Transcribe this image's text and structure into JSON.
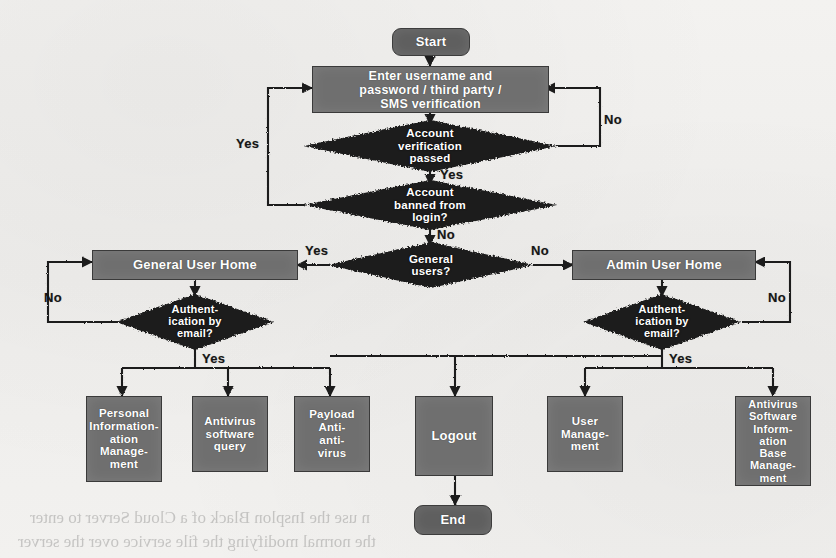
{
  "diagram": {
    "colors": {
      "node_fill": "#6f6f6f",
      "terminal_fill": "#5f5f5f",
      "decision_fill": "#1d1d1d",
      "node_text": "#ffffff",
      "edge_line": "#1a1a1a",
      "label_text": "#161616",
      "page_background": "#f1f0ee"
    },
    "nodes": {
      "start": {
        "label": "Start",
        "shape": "terminator"
      },
      "enter_credentials": {
        "label": "Enter username and password / third party / SMS verification",
        "shape": "process"
      },
      "verify_passed": {
        "label": "Account verification passed",
        "shape": "decision"
      },
      "banned": {
        "label": "Account banned from login?",
        "shape": "decision"
      },
      "general_users": {
        "label": "General users?",
        "shape": "decision"
      },
      "general_home": {
        "label": "General User Home",
        "shape": "process"
      },
      "admin_home": {
        "label": "Admin User Home",
        "shape": "process"
      },
      "auth_email_left": {
        "label": "Authent- ication by email?",
        "shape": "decision"
      },
      "auth_email_right": {
        "label": "Authent- ication by email?",
        "shape": "decision"
      },
      "personal_info": {
        "label": "Personal Information- Manage- ment",
        "shape": "process"
      },
      "antivirus_query": {
        "label": "Antivirus software query",
        "shape": "process"
      },
      "payload_antivirus": {
        "label": "Payload Anti- anti- virus",
        "shape": "process"
      },
      "logout": {
        "label": "Logout",
        "shape": "process"
      },
      "user_management": {
        "label": "User Manage- ment",
        "shape": "process"
      },
      "antivirus_base": {
        "label": "Antivirus Software Inform- ation Base Manage- ment",
        "shape": "process"
      },
      "end": {
        "label": "End",
        "shape": "terminator"
      }
    },
    "node_text_lines": {
      "start": [
        "Start"
      ],
      "enter_credentials": [
        "Enter username and",
        "password / third party /",
        "SMS verification"
      ],
      "verify_passed": [
        "Account",
        "verification",
        "passed"
      ],
      "banned": [
        "Account",
        "banned from",
        "login?"
      ],
      "general_users": [
        "General",
        "users?"
      ],
      "general_home": [
        "General User Home"
      ],
      "admin_home": [
        "Admin User Home"
      ],
      "auth_email_left": [
        "Authent-",
        "ication by",
        "email?"
      ],
      "auth_email_right": [
        "Authent-",
        "ication by",
        "email?"
      ],
      "personal_info": [
        "Personal",
        "Information-",
        "ation",
        "Manage-",
        "ment"
      ],
      "antivirus_query": [
        "Antivirus",
        "software",
        "query"
      ],
      "payload_antivirus": [
        "Payload",
        "Anti-",
        "anti-",
        "virus"
      ],
      "logout": [
        "Logout"
      ],
      "user_management": [
        "User",
        "Manage-",
        "ment"
      ],
      "antivirus_base": [
        "Antivirus",
        "Software",
        "Inform-",
        "ation",
        "Base",
        "Manage-",
        "ment"
      ],
      "end": [
        "End"
      ]
    },
    "edge_labels": {
      "verify_no": "No",
      "verify_yes": "Yes",
      "banned_yes": "Yes",
      "banned_no": "No",
      "general_yes": "Yes",
      "general_no": "No",
      "auth_left_no": "No",
      "auth_left_yes": "Yes",
      "auth_right_no": "No",
      "auth_right_yes": "Yes"
    },
    "ghost_text": {
      "line1": "n use the Insplon Black of a Cloud Server to enter",
      "line2": "the normal modifying the file service over the server"
    }
  }
}
